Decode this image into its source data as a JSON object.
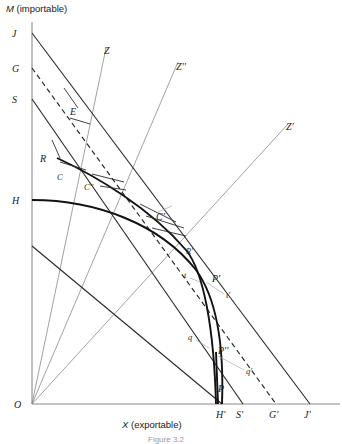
{
  "figure": {
    "caption": "Figure 3.2",
    "axes": {
      "y_label": "M (importable)",
      "y_label_italic": "M",
      "y_label_rest": " (importable)",
      "x_label": "X (exportable)",
      "x_label_italic": "X",
      "x_label_rest": " (exportable)",
      "origin_label": "O"
    },
    "y_axis_points": [
      {
        "label": "J",
        "y": 33
      },
      {
        "label": "G",
        "y": 68
      },
      {
        "label": "S",
        "y": 99
      },
      {
        "label": "H",
        "y": 200
      }
    ],
    "x_axis_points": [
      {
        "label": "H'",
        "x": 222
      },
      {
        "label": "S'",
        "x": 243
      },
      {
        "label": "G'",
        "x": 276
      },
      {
        "label": "J'",
        "x": 310
      }
    ],
    "ray_labels": [
      {
        "label": "Z"
      },
      {
        "label": "Z''"
      },
      {
        "label": "Z'"
      }
    ],
    "equilibrium_points": [
      {
        "label": "E"
      },
      {
        "label": "R"
      },
      {
        "label": "C"
      },
      {
        "label": "C''"
      },
      {
        "label": "C'"
      },
      {
        "label": "R'"
      },
      {
        "label": "P'"
      },
      {
        "label": "P''"
      },
      {
        "label": "P"
      }
    ],
    "tangent_labels": [
      {
        "label": "t"
      },
      {
        "label": "t'"
      },
      {
        "label": "q"
      },
      {
        "label": "q'"
      }
    ],
    "colors": {
      "ink": "#121212",
      "mid_ink": "#2b2b2b",
      "light_ink": "#8a8a8a",
      "background": "#ffffff"
    }
  }
}
